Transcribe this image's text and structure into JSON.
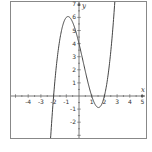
{
  "chart_data": {
    "type": "line",
    "title": "",
    "function": "f(x) = (x+2)(x-1)(x-2) = x^3 - x^2 - 4x + 4",
    "xlabel": "x",
    "ylabel": "y",
    "xlim": [
      -5,
      5.3
    ],
    "ylim": [
      -3.2,
      7.3
    ],
    "x_ticks": [
      -4,
      -3,
      -2,
      -1,
      1,
      2,
      3,
      4,
      5
    ],
    "y_ticks": [
      -2,
      -1,
      1,
      2,
      3,
      4,
      5,
      6,
      7
    ],
    "x_tick_labels": [
      "-4",
      "-3",
      "-2",
      "-1",
      "1",
      "2",
      "3",
      "4",
      "5"
    ],
    "y_tick_labels": [
      "-2",
      "-1",
      "1",
      "2",
      "3",
      "4",
      "5",
      "6",
      "7"
    ],
    "grid": false,
    "series": [
      {
        "name": "f(x)",
        "coefficients": [
          1,
          -1,
          -4,
          4
        ],
        "x": [
          -2.2,
          -2,
          -1.5,
          -1,
          -0.87,
          -0.5,
          0,
          0.5,
          1,
          1.54,
          2,
          2.5,
          2.8
        ],
        "y": [
          -1.73,
          0,
          4.38,
          6,
          6.06,
          5.63,
          4,
          1.88,
          0,
          -0.88,
          0,
          3.38,
          7.23
        ]
      }
    ],
    "roots": [
      -2,
      1,
      2
    ],
    "y_intercept": 4,
    "colors": {
      "curve": "#444444",
      "axes": "#555555",
      "frame": "#888888"
    }
  }
}
